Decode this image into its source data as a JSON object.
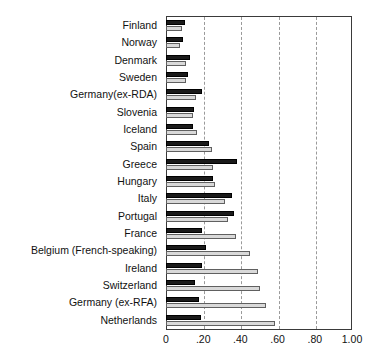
{
  "chart_data": {
    "type": "bar",
    "orientation": "horizontal",
    "title": "",
    "subtitle": "",
    "xlabel": "",
    "ylabel": "",
    "xlim": [
      0,
      1.0
    ],
    "grid": true,
    "grid_axis": "x",
    "grid_style": "dashed",
    "legend": null,
    "legend_position": "none",
    "xticks": [
      "0",
      ".20",
      ".40",
      ".60",
      ".80",
      "1.00"
    ],
    "xtick_values": [
      0,
      0.2,
      0.4,
      0.6,
      0.8,
      1.0
    ],
    "categories": [
      "Finland",
      "Norway",
      "Denmark",
      "Sweden",
      "Germany(ex-RDA)",
      "Slovenia",
      "Iceland",
      "Spain",
      "Greece",
      "Hungary",
      "Italy",
      "Portugal",
      "France",
      "Belgium (French-speaking)",
      "Ireland",
      "Switzerland",
      "Germany (ex-RFA)",
      "Netherlands"
    ],
    "series": [
      {
        "name": "series-dark",
        "color": "#1a1a1a",
        "values": [
          0.1,
          0.09,
          0.13,
          0.12,
          0.195,
          0.15,
          0.145,
          0.23,
          0.38,
          0.25,
          0.355,
          0.365,
          0.195,
          0.215,
          0.195,
          0.155,
          0.18,
          0.19
        ]
      },
      {
        "name": "series-light",
        "color": "#d9d9d9",
        "values": [
          0.085,
          0.075,
          0.11,
          0.105,
          0.16,
          0.145,
          0.165,
          0.245,
          0.25,
          0.265,
          0.315,
          0.335,
          0.375,
          0.45,
          0.495,
          0.505,
          0.54,
          0.585
        ]
      }
    ]
  }
}
